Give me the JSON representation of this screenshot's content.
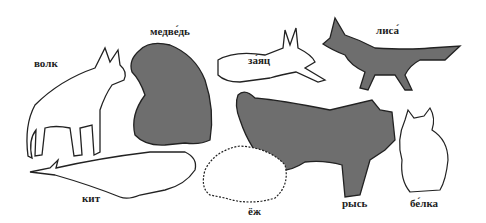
{
  "labels": {
    "wolf": "волк",
    "bear": "медве́дь",
    "hare": "за́яц",
    "fox": "лиса́",
    "whale": "кит",
    "hedgehog": "ёж",
    "lynx": "рысь",
    "squirrel": "бе́лка"
  },
  "colors": {
    "dark_fill": "#6e6e6e",
    "outline": "#222222",
    "light_fill": "#ffffff"
  }
}
